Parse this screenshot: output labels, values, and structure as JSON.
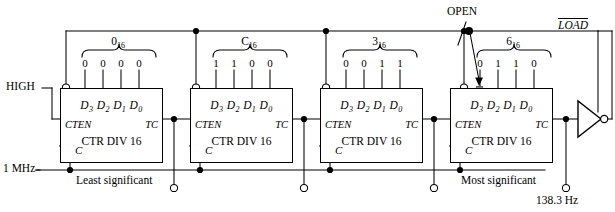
{
  "diagram": {
    "signals": {
      "high": "HIGH",
      "clock_in": "1 MHz",
      "open": "OPEN",
      "load": "LOAD",
      "output_freq": "138.3 Hz"
    },
    "annotations": {
      "least_significant": "Least significant",
      "most_significant": "Most significant"
    },
    "counters": [
      {
        "id": "counter-0",
        "hex_value": "0",
        "hex_base": "16",
        "bits": [
          "0",
          "0",
          "0",
          "0"
        ],
        "data_inputs": "D",
        "data_subs": [
          "3",
          "2",
          "1",
          "0"
        ],
        "enable_label": "CTEN",
        "terminal_count_label": "TC",
        "body_label": "CTR DIV 16",
        "clock_label": "C",
        "position_note": "Least significant"
      },
      {
        "id": "counter-1",
        "hex_value": "C",
        "hex_base": "16",
        "bits": [
          "1",
          "1",
          "0",
          "0"
        ],
        "data_inputs": "D",
        "data_subs": [
          "3",
          "2",
          "1",
          "0"
        ],
        "enable_label": "CTEN",
        "terminal_count_label": "TC",
        "body_label": "CTR DIV 16",
        "clock_label": "C",
        "position_note": ""
      },
      {
        "id": "counter-2",
        "hex_value": "3",
        "hex_base": "16",
        "bits": [
          "0",
          "0",
          "1",
          "1"
        ],
        "data_inputs": "D",
        "data_subs": [
          "3",
          "2",
          "1",
          "0"
        ],
        "enable_label": "CTEN",
        "terminal_count_label": "TC",
        "body_label": "CTR DIV 16",
        "clock_label": "C",
        "position_note": ""
      },
      {
        "id": "counter-3",
        "hex_value": "6",
        "hex_base": "16",
        "bits": [
          "0",
          "1",
          "1",
          "0"
        ],
        "data_inputs": "D",
        "data_subs": [
          "3",
          "2",
          "1",
          "0"
        ],
        "enable_label": "CTEN",
        "terminal_count_label": "TC",
        "body_label": "CTR DIV 16",
        "clock_label": "C",
        "position_note": "Most significant"
      }
    ],
    "colors": {
      "wire": "#000000",
      "box_border": "#000000",
      "background": "#ffffff"
    }
  }
}
